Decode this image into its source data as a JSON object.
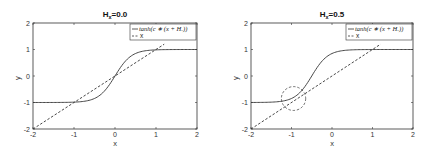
{
  "chart_data": [
    {
      "type": "line",
      "title": "H_x=0.0",
      "title_main": "H",
      "title_sub": "x",
      "title_rest": "=0.0",
      "xlabel": "x",
      "ylabel": "y",
      "xlim": [
        -2,
        2
      ],
      "ylim": [
        -2,
        2
      ],
      "xticks": [
        "-2",
        "-1",
        "0",
        "1",
        "2"
      ],
      "yticks": [
        "2",
        "1",
        "0",
        "-1",
        "-2"
      ],
      "grid": false,
      "legend_position": "upper right",
      "legend": [
        "tanh(c*(x+H_x))",
        "x"
      ],
      "legend_labels": [
        "tanh(c ∗ (x + Hₓ))",
        "x"
      ],
      "series": [
        {
          "name": "tanh(c*(x+H_x))",
          "style": "solid",
          "c": 2.5,
          "Hx": 0.0,
          "x": [
            -2,
            -1.5,
            -1,
            -0.75,
            -0.5,
            -0.25,
            0,
            0.25,
            0.5,
            0.75,
            1,
            1.5,
            2
          ],
          "y": [
            -1.0,
            -1.0,
            -0.99,
            -0.95,
            -0.85,
            -0.56,
            0.0,
            0.56,
            0.85,
            0.95,
            0.99,
            1.0,
            1.0
          ]
        },
        {
          "name": "x",
          "style": "dashed",
          "x": [
            -2,
            1.2
          ],
          "y": [
            -2,
            1.2
          ]
        }
      ],
      "annotations": []
    },
    {
      "type": "line",
      "title": "H_x=0.5",
      "title_main": "H",
      "title_sub": "x",
      "title_rest": "=0.5",
      "xlabel": "x",
      "ylabel": "y",
      "xlim": [
        -2,
        2
      ],
      "ylim": [
        -2,
        2
      ],
      "xticks": [
        "-2",
        "-1",
        "0",
        "1",
        "2"
      ],
      "yticks": [
        "2",
        "1",
        "0",
        "-1",
        "-2"
      ],
      "grid": false,
      "legend_position": "upper right",
      "legend": [
        "tanh(c*(x+H_x))",
        "x"
      ],
      "legend_labels": [
        "tanh(c ∗ (x + Hₓ))",
        "x"
      ],
      "series": [
        {
          "name": "tanh(c*(x+H_x))",
          "style": "solid",
          "c": 2.5,
          "Hx": 0.5,
          "x": [
            -2,
            -1.5,
            -1.25,
            -1,
            -0.75,
            -0.5,
            -0.25,
            0,
            0.25,
            0.5,
            1,
            2
          ],
          "y": [
            -1.0,
            -0.99,
            -0.95,
            -0.85,
            -0.56,
            0.0,
            0.56,
            0.85,
            0.95,
            0.99,
            1.0,
            1.0
          ]
        },
        {
          "name": "x",
          "style": "dashed",
          "x": [
            -2,
            1.2
          ],
          "y": [
            -2,
            1.2
          ]
        }
      ],
      "annotations": [
        {
          "type": "dashed-circle",
          "center": [
            -0.95,
            -0.85
          ],
          "radius_x": 0.3,
          "radius_y": 0.45
        }
      ]
    }
  ]
}
